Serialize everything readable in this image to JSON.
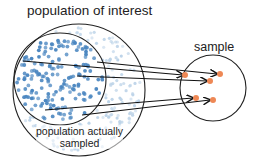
{
  "labels": {
    "population_of_interest": "population of interest",
    "sample": "sample",
    "population_actually_sampled_line1": "population actually",
    "population_actually_sampled_line2": "sampled"
  },
  "colors": {
    "population_dot": "#4a86c0",
    "faint_dot": "#bcd3e8",
    "sample_dot": "#ee8855",
    "stroke": "#222222"
  },
  "shapes": {
    "population_circle": {
      "cx": 79,
      "cy": 90,
      "r": 66
    },
    "sampled_circle": {
      "cx": 60,
      "cy": 79,
      "r": 46
    },
    "sample_circle": {
      "cx": 213,
      "cy": 88,
      "r": 33
    }
  },
  "arrows": [
    {
      "from": [
        23,
        61
      ],
      "to": [
        183,
        75
      ]
    },
    {
      "from": [
        97,
        62
      ],
      "to": [
        217,
        74
      ]
    },
    {
      "from": [
        77,
        76
      ],
      "to": [
        207,
        81
      ]
    },
    {
      "from": [
        45,
        110
      ],
      "to": [
        193,
        98
      ]
    },
    {
      "from": [
        82,
        115
      ],
      "to": [
        210,
        100
      ]
    }
  ],
  "sample_points": [
    [
      185,
      75
    ],
    [
      220,
      74
    ],
    [
      210,
      81
    ],
    [
      196,
      98
    ],
    [
      213,
      100
    ]
  ]
}
